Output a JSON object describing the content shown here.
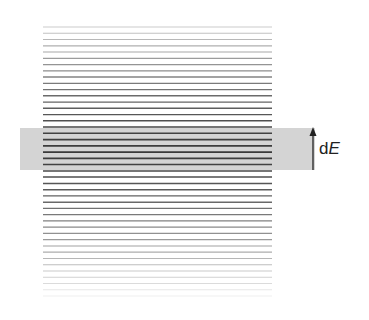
{
  "diagram": {
    "title": "",
    "lines": {
      "count": 44,
      "x_start": 43,
      "x_end": 272,
      "y_start": 27,
      "y_end": 296,
      "center_y": 150,
      "color": "#3a3a3a"
    },
    "band": {
      "x": 20,
      "y": 128,
      "width": 295,
      "height": 42,
      "color": "#d4d4d4"
    },
    "arrow": {
      "x": 313,
      "y_top": 128,
      "y_bottom": 170,
      "color": "#222222"
    },
    "label": {
      "prefix": "d",
      "symbol": "E"
    }
  }
}
